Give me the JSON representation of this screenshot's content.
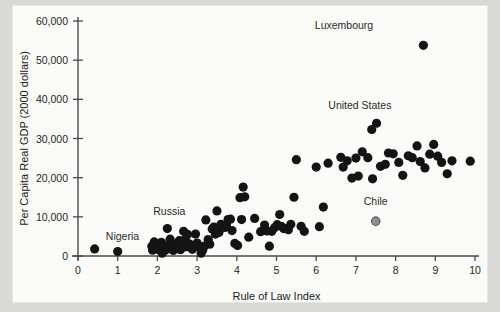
{
  "figure": {
    "background_color": "#d8d8d6",
    "plate_color": "#fbfbfa",
    "point_color": "#141414",
    "highlight_point_color": "#8e8e8e"
  },
  "chart_data": {
    "type": "scatter",
    "title": "",
    "xlabel": "Rule of Law Index",
    "ylabel": "Per Capita Real GDP (2000 dollars)",
    "xlim": [
      0,
      10
    ],
    "ylim": [
      0,
      60000
    ],
    "xticks": [
      0,
      1,
      2,
      3,
      4,
      5,
      6,
      7,
      8,
      9,
      10
    ],
    "xticklabels": [
      "0",
      "1",
      "2",
      "3",
      "4",
      "5",
      "6",
      "7",
      "8",
      "9",
      "10"
    ],
    "yticks": [
      0,
      10000,
      20000,
      30000,
      40000,
      50000,
      60000
    ],
    "yticklabels": [
      "0",
      "10,000",
      "20,000",
      "30,000",
      "40,000",
      "50,000",
      "60,000"
    ],
    "grid": false,
    "legend": null,
    "marker": "circle",
    "marker_size": 4.6,
    "points": [
      [
        0.42,
        1800
      ],
      [
        1.0,
        1150
      ],
      [
        1.86,
        2500
      ],
      [
        1.88,
        1500
      ],
      [
        1.92,
        3600
      ],
      [
        1.95,
        2600
      ],
      [
        2.02,
        2400
      ],
      [
        2.05,
        1550
      ],
      [
        2.1,
        3500
      ],
      [
        2.12,
        700
      ],
      [
        2.18,
        2600
      ],
      [
        2.2,
        1500
      ],
      [
        2.25,
        7000
      ],
      [
        2.28,
        2200
      ],
      [
        2.32,
        4300
      ],
      [
        2.35,
        2500
      ],
      [
        2.4,
        1400
      ],
      [
        2.42,
        3000
      ],
      [
        2.48,
        2350
      ],
      [
        2.52,
        2000
      ],
      [
        2.55,
        3900
      ],
      [
        2.58,
        1600
      ],
      [
        2.62,
        2550
      ],
      [
        2.66,
        6300
      ],
      [
        2.7,
        4200
      ],
      [
        2.72,
        2350
      ],
      [
        2.76,
        5500
      ],
      [
        2.8,
        3100
      ],
      [
        2.84,
        2450
      ],
      [
        2.88,
        1700
      ],
      [
        2.92,
        2600
      ],
      [
        2.96,
        5600
      ],
      [
        3.0,
        3300
      ],
      [
        3.05,
        2300
      ],
      [
        3.1,
        700
      ],
      [
        3.14,
        1500
      ],
      [
        3.18,
        2500
      ],
      [
        3.22,
        9200
      ],
      [
        3.28,
        4200
      ],
      [
        3.32,
        3000
      ],
      [
        3.38,
        6900
      ],
      [
        3.42,
        7400
      ],
      [
        3.46,
        5600
      ],
      [
        3.5,
        11500
      ],
      [
        3.55,
        6000
      ],
      [
        3.6,
        8100
      ],
      [
        3.64,
        7600
      ],
      [
        3.7,
        7300
      ],
      [
        3.74,
        7900
      ],
      [
        3.78,
        9300
      ],
      [
        3.84,
        9400
      ],
      [
        3.88,
        6500
      ],
      [
        3.95,
        3200
      ],
      [
        4.02,
        2700
      ],
      [
        4.08,
        14900
      ],
      [
        4.12,
        9300
      ],
      [
        4.16,
        17600
      ],
      [
        4.2,
        15100
      ],
      [
        4.3,
        4800
      ],
      [
        4.45,
        9600
      ],
      [
        4.6,
        6200
      ],
      [
        4.7,
        7900
      ],
      [
        4.76,
        6400
      ],
      [
        4.82,
        2500
      ],
      [
        4.88,
        6300
      ],
      [
        4.95,
        7200
      ],
      [
        5.02,
        8000
      ],
      [
        5.08,
        10600
      ],
      [
        5.12,
        7600
      ],
      [
        5.18,
        7000
      ],
      [
        5.24,
        7000
      ],
      [
        5.3,
        6700
      ],
      [
        5.36,
        8100
      ],
      [
        5.44,
        15000
      ],
      [
        5.5,
        24600
      ],
      [
        5.62,
        7600
      ],
      [
        5.7,
        6300
      ],
      [
        6.18,
        12500
      ],
      [
        6.3,
        23700
      ],
      [
        6.62,
        25200
      ],
      [
        6.68,
        22700
      ],
      [
        6.78,
        24300
      ],
      [
        6.9,
        19900
      ],
      [
        7.0,
        25000
      ],
      [
        7.06,
        20400
      ],
      [
        7.16,
        26600
      ],
      [
        7.3,
        25100
      ],
      [
        7.42,
        19700
      ],
      [
        7.5,
        8900
      ],
      [
        7.62,
        22900
      ],
      [
        7.74,
        23400
      ],
      [
        7.82,
        26300
      ],
      [
        7.94,
        26100
      ],
      [
        8.08,
        23900
      ],
      [
        8.18,
        20600
      ],
      [
        8.32,
        25600
      ],
      [
        8.42,
        25100
      ],
      [
        8.54,
        28100
      ],
      [
        8.62,
        24100
      ],
      [
        8.7,
        53800
      ],
      [
        8.74,
        22500
      ],
      [
        8.86,
        26000
      ],
      [
        8.96,
        28500
      ],
      [
        9.06,
        25500
      ],
      [
        9.16,
        23900
      ],
      [
        9.3,
        21000
      ],
      [
        9.42,
        24300
      ],
      [
        9.88,
        24200
      ],
      [
        7.52,
        33900
      ],
      [
        7.4,
        32300
      ],
      [
        6.08,
        7500
      ],
      [
        6.0,
        22700
      ]
    ],
    "highlighted_points": [
      {
        "label": "Chile",
        "x": 7.5,
        "y": 8900,
        "color": "#8e8e8e"
      }
    ],
    "annotations": [
      {
        "label": "Luxembourg",
        "x": 8.7,
        "y": 53800,
        "label_dx": -2,
        "label_dy": 4200
      },
      {
        "label": "United States",
        "x": 7.4,
        "y": 32300,
        "label_dx": -0.3,
        "label_dy": 5200
      },
      {
        "label": "Russia",
        "x": 2.25,
        "y": 7000,
        "label_dx": 0.05,
        "label_dy": 3400
      },
      {
        "label": "Nigeria",
        "x": 1.0,
        "y": 1150,
        "label_dx": 0.12,
        "label_dy": 2900
      },
      {
        "label": "Chile",
        "x": 7.5,
        "y": 8900,
        "label_dx": 0.0,
        "label_dy": 4000
      }
    ]
  }
}
